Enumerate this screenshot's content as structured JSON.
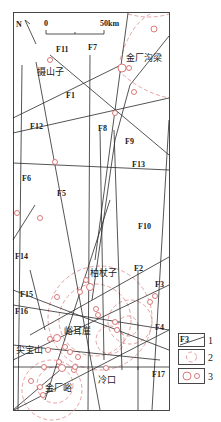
{
  "map": {
    "north_label": "N",
    "scale": {
      "start": "0",
      "end": "50km"
    },
    "faults": [
      {
        "id": "F1",
        "label": "F1"
      },
      {
        "id": "F2",
        "label": "F2"
      },
      {
        "id": "F3",
        "label": "F3"
      },
      {
        "id": "F4",
        "label": "F4"
      },
      {
        "id": "F5",
        "label": "F5"
      },
      {
        "id": "F6",
        "label": "F6"
      },
      {
        "id": "F7",
        "label": "F7"
      },
      {
        "id": "F8",
        "label": "F8"
      },
      {
        "id": "F9",
        "label": "F9"
      },
      {
        "id": "F10",
        "label": "F10"
      },
      {
        "id": "F11",
        "label": "F11"
      },
      {
        "id": "F12",
        "label": "F12"
      },
      {
        "id": "F13",
        "label": "F13"
      },
      {
        "id": "F14",
        "label": "F14"
      },
      {
        "id": "F15",
        "label": "F15"
      },
      {
        "id": "F16",
        "label": "F16"
      },
      {
        "id": "F17",
        "label": "F17"
      }
    ],
    "places": [
      {
        "id": "jinchanggouliang",
        "label": "金厂沟梁"
      },
      {
        "id": "yaoshanzi",
        "label": "摄山子"
      },
      {
        "id": "baizhangzi",
        "label": "柏杖子"
      },
      {
        "id": "yuerya",
        "label": "峪耳崖"
      },
      {
        "id": "jianbaoshan",
        "label": "尖宝山"
      },
      {
        "id": "jinchangyu",
        "label": "金厂峪"
      },
      {
        "id": "lengkou",
        "label": "冷口"
      }
    ]
  },
  "legend": {
    "items": [
      {
        "num": "1",
        "symbol_label": "F3",
        "meaning": "fault"
      },
      {
        "num": "2",
        "meaning": "dashed-circle"
      },
      {
        "num": "3",
        "meaning": "deposit-circles"
      }
    ]
  }
}
